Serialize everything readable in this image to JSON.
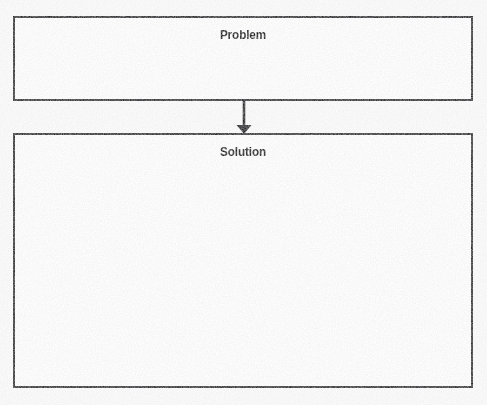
{
  "document": {
    "type": "graphic-organizer",
    "title": "Problem and Solution Organizer",
    "background_color": "#fcfcfc",
    "width": 487,
    "height": 405
  },
  "style": {
    "border_color": "#2b2b2d",
    "border_width": "2px",
    "box_fill": "#ffffff",
    "text_color": "#131314",
    "connector_color": "#1f1f21"
  },
  "boxes": [
    {
      "id": "problem",
      "label": "Problem",
      "content": "",
      "x": 13,
      "y": 16,
      "width": 460,
      "height": 85
    },
    {
      "id": "solution",
      "label": "Solution",
      "content": "",
      "x": 13,
      "y": 133,
      "width": 460,
      "height": 255
    }
  ],
  "connector": {
    "id": "problem-to-solution",
    "shape": "arrow",
    "direction": "down",
    "from": "problem",
    "to": "solution",
    "x": 244,
    "y_start": 101,
    "y_end": 133
  }
}
